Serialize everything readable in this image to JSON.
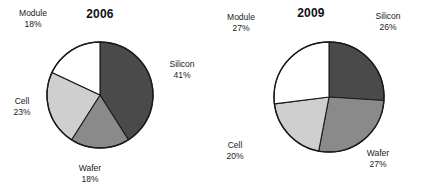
{
  "chart_data": [
    {
      "type": "pie",
      "title": "2006",
      "categories": [
        "Silicon",
        "Wafer",
        "Cell",
        "Module"
      ],
      "values": [
        41,
        18,
        23,
        18
      ],
      "value_labels": [
        "41%",
        "18%",
        "23%",
        "18%"
      ],
      "colors": [
        "#4a4a4a",
        "#8a8a8a",
        "#cfcfcf",
        "#ffffff"
      ],
      "start_angle_deg": 0,
      "direction": "clockwise",
      "units": "percent",
      "legend": "none",
      "grid": false,
      "labels": [
        {
          "name": "Silicon",
          "pct": "41%"
        },
        {
          "name": "Wafer",
          "pct": "18%"
        },
        {
          "name": "Cell",
          "pct": "23%"
        },
        {
          "name": "Module",
          "pct": "18%"
        }
      ]
    },
    {
      "type": "pie",
      "title": "2009",
      "categories": [
        "Silicon",
        "Wafer",
        "Cell",
        "Module"
      ],
      "values": [
        26,
        27,
        20,
        27
      ],
      "value_labels": [
        "26%",
        "27%",
        "20%",
        "27%"
      ],
      "colors": [
        "#4a4a4a",
        "#8a8a8a",
        "#cfcfcf",
        "#ffffff"
      ],
      "start_angle_deg": 0,
      "direction": "clockwise",
      "units": "percent",
      "legend": "none",
      "grid": false,
      "labels": [
        {
          "name": "Silicon",
          "pct": "26%"
        },
        {
          "name": "Wafer",
          "pct": "27%"
        },
        {
          "name": "Cell",
          "pct": "20%"
        },
        {
          "name": "Module",
          "pct": "27%"
        }
      ]
    }
  ],
  "style": {
    "outline_color": "#1a1a1a",
    "background": "#ffffff",
    "text_color": "#1a1a1a"
  }
}
